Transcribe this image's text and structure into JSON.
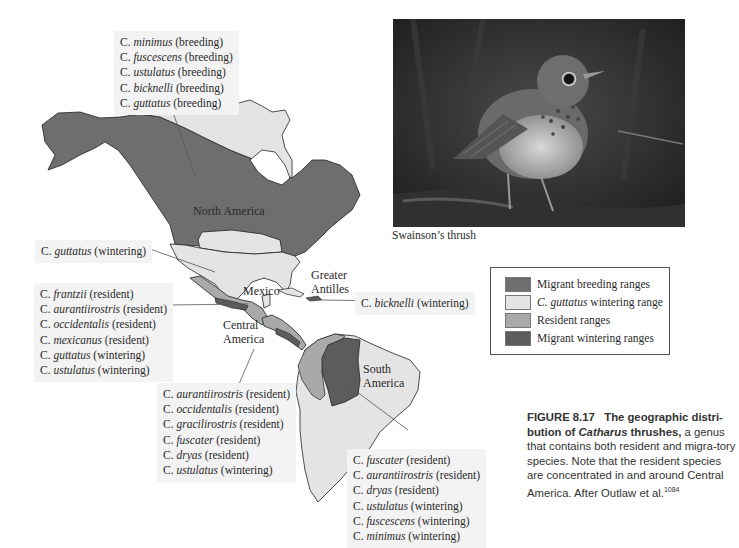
{
  "colors": {
    "migrant_breeding": "#6e6e6e",
    "guttatus_wintering": "#e4e4e4",
    "resident": "#a9a9a9",
    "migrant_wintering": "#5c5c5c",
    "label_bg": "#f3f3f3"
  },
  "map": {
    "region_labels": {
      "north_america": "North America",
      "mexico": "Mexico",
      "greater_antilles_1": "Greater",
      "greater_antilles_2": "Antilles",
      "central_america_1": "Central",
      "central_america_2": "America",
      "south_america_1": "South",
      "south_america_2": "America"
    },
    "callouts": {
      "breeding": [
        {
          "genus": "C.",
          "species": "minimus",
          "status": "(breeding)"
        },
        {
          "genus": "C.",
          "species": "fuscescens",
          "status": "(breeding)"
        },
        {
          "genus": "C.",
          "species": "ustulatus",
          "status": "(breeding)"
        },
        {
          "genus": "C.",
          "species": "bicknelli",
          "status": "(breeding)"
        },
        {
          "genus": "C.",
          "species": "guttatus",
          "status": "(breeding)"
        }
      ],
      "guttatus_wintering": [
        {
          "genus": "C.",
          "species": "guttatus",
          "status": "(wintering)"
        }
      ],
      "mexico": [
        {
          "genus": "C.",
          "species": "frantzii",
          "status": "(resident)"
        },
        {
          "genus": "C.",
          "species": "aurantiirostris",
          "status": "(resident)"
        },
        {
          "genus": "C.",
          "species": "occidentalis",
          "status": "(resident)"
        },
        {
          "genus": "C.",
          "species": "mexicanus",
          "status": "(resident)"
        },
        {
          "genus": "C.",
          "species": "guttatus",
          "status": "(wintering)"
        },
        {
          "genus": "C.",
          "species": "ustulatus",
          "status": "(wintering)"
        }
      ],
      "bicknelli_wintering": [
        {
          "genus": "C.",
          "species": "bicknelli",
          "status": "(wintering)"
        }
      ],
      "central_america": [
        {
          "genus": "C.",
          "species": "aurantiirostris",
          "status": "(resident)"
        },
        {
          "genus": "C.",
          "species": "occidentalis",
          "status": "(resident)"
        },
        {
          "genus": "C.",
          "species": "gracilirostris",
          "status": "(resident)"
        },
        {
          "genus": "C.",
          "species": "fuscater",
          "status": "(resident)"
        },
        {
          "genus": "C.",
          "species": "dryas",
          "status": "(resident)"
        },
        {
          "genus": "C.",
          "species": "ustulatus",
          "status": "(wintering)"
        }
      ],
      "south_america": [
        {
          "genus": "C.",
          "species": "fuscater",
          "status": "(resident)"
        },
        {
          "genus": "C.",
          "species": "aurantiirostris",
          "status": "(resident)"
        },
        {
          "genus": "C.",
          "species": "dryas",
          "status": "(resident)"
        },
        {
          "genus": "C.",
          "species": "ustulatus",
          "status": "(wintering)"
        },
        {
          "genus": "C.",
          "species": "fuscescens",
          "status": "(wintering)"
        },
        {
          "genus": "C.",
          "species": "minimus",
          "status": "(wintering)"
        }
      ]
    }
  },
  "photo": {
    "caption": "Swainson’s thrush"
  },
  "legend": {
    "items": [
      {
        "label": "Migrant breeding ranges",
        "italic_prefix": ""
      },
      {
        "label": " wintering range",
        "italic_prefix": "C. guttatus"
      },
      {
        "label": "Resident ranges",
        "italic_prefix": ""
      },
      {
        "label": "Migrant wintering ranges",
        "italic_prefix": ""
      }
    ]
  },
  "figure_caption": {
    "number": "FIGURE 8.17",
    "bold_lead_1": "The geographic distri-bution of ",
    "bold_italic": "Catharus",
    "bold_lead_2": " thrushes,",
    "body": " a genus that contains both resident and migra-tory species. Note that the resident species are concentrated in and around Central America. After Outlaw et al.",
    "reference": "1084"
  }
}
